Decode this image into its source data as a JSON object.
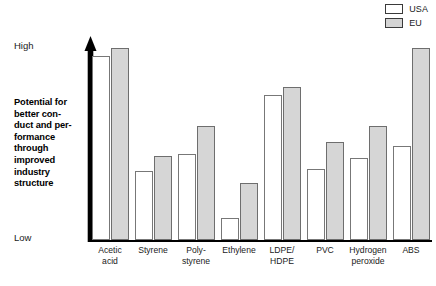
{
  "legend": {
    "items": [
      {
        "label": "USA",
        "swatch": "white-outline",
        "color": "#ffffff"
      },
      {
        "label": "EU",
        "swatch": "gray-filled",
        "color": "#d4d4d4"
      }
    ]
  },
  "axis": {
    "high_label": "High",
    "low_label": "Low",
    "caption_lines": [
      "Potential for",
      "better con-",
      "duct and per-",
      "formance",
      "through",
      "improved",
      "industry",
      "structure"
    ]
  },
  "categories_display": [
    {
      "lines": [
        "Acetic",
        "acid"
      ]
    },
    {
      "lines": [
        "Styrene"
      ]
    },
    {
      "lines": [
        "Poly-",
        "styrene"
      ]
    },
    {
      "lines": [
        "Ethylene"
      ]
    },
    {
      "lines": [
        "LDPE/",
        "HDPE"
      ]
    },
    {
      "lines": [
        "PVC"
      ]
    },
    {
      "lines": [
        "Hydrogen",
        "peroxide"
      ]
    },
    {
      "lines": [
        "ABS"
      ]
    }
  ],
  "chart_data": {
    "type": "bar",
    "title": "",
    "subtitle": "",
    "xlabel": "",
    "ylabel": "Potential for better conduct and performance through improved industry structure",
    "ylim": [
      0,
      100
    ],
    "ytick_labels": [
      "Low",
      "High"
    ],
    "grid": false,
    "legend_position": "top-right",
    "categories": [
      "Acetic acid",
      "Styrene",
      "Poly-styrene",
      "Ethylene",
      "LDPE/HDPE",
      "PVC",
      "Hydrogen peroxide",
      "ABS"
    ],
    "series": [
      {
        "name": "USA",
        "color": "#ffffff",
        "values": [
          90,
          34,
          42,
          11,
          71,
          35,
          40,
          46
        ]
      },
      {
        "name": "EU",
        "color": "#d4d4d4",
        "values": [
          94,
          41,
          56,
          28,
          75,
          48,
          56,
          94
        ]
      }
    ]
  },
  "colors": {
    "axis": "#000000",
    "usa_fill": "#ffffff",
    "usa_border": "#777777",
    "eu_fill": "#d6d6d6",
    "eu_border": "#6e6e6e",
    "text": "#1a1a1a"
  }
}
